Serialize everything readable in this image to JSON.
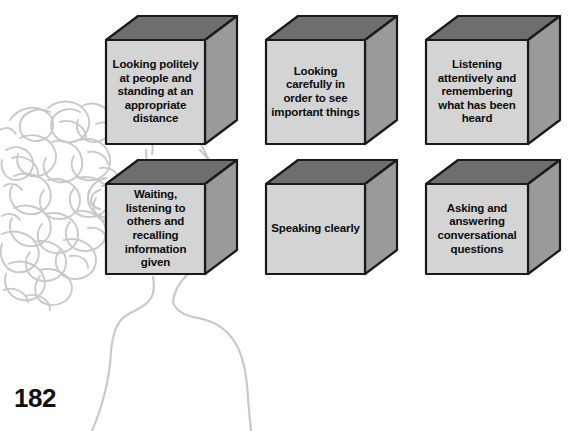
{
  "page": {
    "number": "182",
    "background_color": "#ffffff"
  },
  "figure": {
    "name": "head-and-shoulders-outline",
    "line_color": "#c9c9c9",
    "hair_color": "#c9c9c9"
  },
  "colors": {
    "cube_front": "#d4d4d4",
    "cube_top": "#6e6e6e",
    "cube_side": "#9a9a9a",
    "cube_outline": "#1a1a1a",
    "text": "#0d0d0d"
  },
  "cubes": [
    {
      "id": "cube-looking-politely",
      "text": "Looking politely at people and standing at an appropriate distance",
      "row": 1,
      "column": 1,
      "font_size": 11.5
    },
    {
      "id": "cube-looking-carefully",
      "text": "Looking carefully in order to see important things",
      "row": 1,
      "column": 2,
      "font_size": 11.5
    },
    {
      "id": "cube-listening-attentively",
      "text": "Listening attentively and remembering what has been heard",
      "row": 1,
      "column": 3,
      "font_size": 11.5
    },
    {
      "id": "cube-waiting-listening",
      "text": "Waiting, listening to others and recalling information given",
      "row": 2,
      "column": 1,
      "font_size": 11.5
    },
    {
      "id": "cube-speaking-clearly",
      "text": "Speaking clearly",
      "row": 2,
      "column": 2,
      "font_size": 11.5
    },
    {
      "id": "cube-asking-answering",
      "text": "Asking and answering conversational questions",
      "row": 2,
      "column": 3,
      "font_size": 11.5
    }
  ]
}
